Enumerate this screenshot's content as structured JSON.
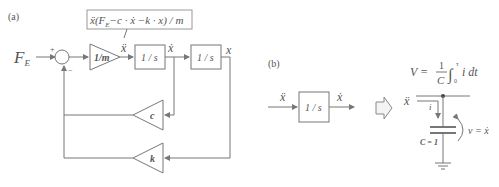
{
  "panel_a": {
    "label": "(a)",
    "input": "F",
    "input_sub": "E",
    "sum_plus": "+",
    "sum_minus": "−",
    "gain_m": "1/m",
    "integrator1": "1 / s",
    "integrator2": "1 / s",
    "signal_accel": "ẍ",
    "signal_vel": "ẋ",
    "signal_pos": "x",
    "feedback_c": "c",
    "feedback_k": "k",
    "equation": "ẍ(F_E − c · ẋ − k · x) / m",
    "eq_x": "ẍ",
    "eq_open": "(",
    "eq_F": "F",
    "eq_Fsub": "E",
    "eq_rest": "−c · ẋ −k · x",
    "eq_close": ") / m"
  },
  "panel_b": {
    "label": "(b)",
    "input": "ẍ",
    "integrator": "1 / s",
    "output": "ẋ",
    "arrow": "⇨",
    "voltage_eq_lhs": "V =",
    "voltage_eq_num": "1",
    "voltage_eq_den": "C",
    "voltage_eq_int": "∫",
    "voltage_eq_upper": "τ",
    "voltage_eq_lower": "0",
    "voltage_eq_body": "i dt",
    "current_source_label": "ẍ",
    "current_label": "i",
    "capacitance": "C = 1",
    "voltage_label": "v = ẋ"
  }
}
